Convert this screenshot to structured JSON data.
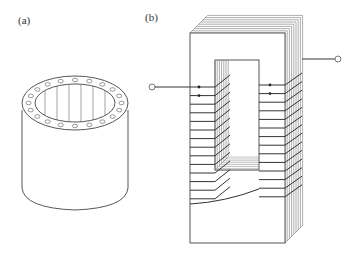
{
  "figure": {
    "panel_a": {
      "label": "(a)",
      "description": "Toroidal / cylindrical core with conductors around ring",
      "pin_count": 20
    },
    "panel_b": {
      "label": "(b)",
      "description": "Laminated rectangular transformer core with windings on both legs",
      "left_winding_turns": 14,
      "right_winding_turns": 14,
      "lamination_count": 8,
      "terminals": 2
    }
  },
  "colors": {
    "stroke": "#444444",
    "light_stroke": "#888888",
    "background": "#ffffff"
  }
}
